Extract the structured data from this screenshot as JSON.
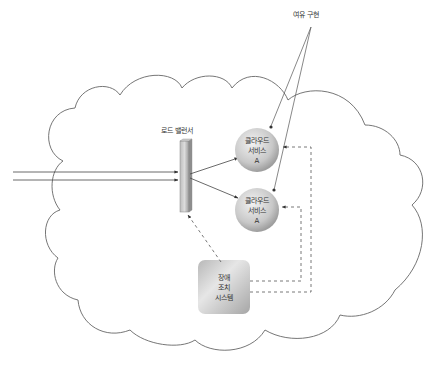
{
  "labels": {
    "redundancy": "여유 구현",
    "load_balancer": "로드 밸런서"
  },
  "nodes": {
    "service_top": {
      "line1": "클라우드",
      "line2": "서비스",
      "line3": "A"
    },
    "service_bottom": {
      "line1": "클라우드",
      "line2": "서비스",
      "line3": "A"
    },
    "failover": {
      "line1": "장애",
      "line2": "조치",
      "line3": "시스템"
    }
  },
  "colors": {
    "stroke": "#555555",
    "sphere_light": "#e8e8e8",
    "sphere_dark": "#a8a8a8",
    "box_light": "#e4e4e4",
    "box_dark": "#aaaaaa"
  }
}
